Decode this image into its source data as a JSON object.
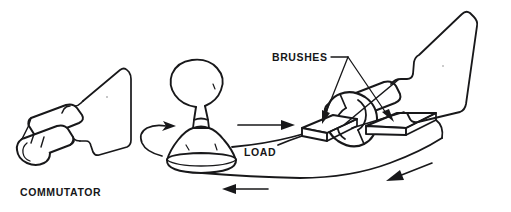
{
  "figure": {
    "background_color": "#ffffff",
    "line_color": "#18181a",
    "text_color": "#161618",
    "style": "black-and-white line drawing"
  },
  "labels": {
    "commutator": "COMMUTATOR",
    "brushes": "BRUSHES",
    "load": "LOAD"
  },
  "parts": [
    {
      "name": "commutator",
      "label": "COMMUTATOR",
      "description": "split-ring commutator cylinder at lower left"
    },
    {
      "name": "armature-loop-left",
      "label": "",
      "description": "rectangular wire loop attached to left commutator"
    },
    {
      "name": "lamp-load",
      "label": "LOAD",
      "description": "light bulb representing the electrical load in the center"
    },
    {
      "name": "brushes",
      "label": "BRUSHES",
      "description": "two flat contact brushes riding on the right commutator"
    },
    {
      "name": "commutator-right",
      "label": "",
      "description": "split-ring commutator inside the brush assembly at right"
    },
    {
      "name": "armature-loop-right",
      "label": "",
      "description": "rectangular wire loop rising from the right commutator"
    }
  ],
  "current_arrows": [
    {
      "name": "rotation-arrow-load-base",
      "direction": "counterclockwise",
      "location": "around lamp base"
    },
    {
      "name": "current-arrow-top",
      "direction": "right",
      "location": "upper wire toward LOAD label"
    },
    {
      "name": "current-arrow-return-left",
      "direction": "left",
      "location": "lower return wire near lamp"
    },
    {
      "name": "current-arrow-return-right",
      "direction": "left",
      "location": "lower return wire toward right assembly"
    }
  ]
}
